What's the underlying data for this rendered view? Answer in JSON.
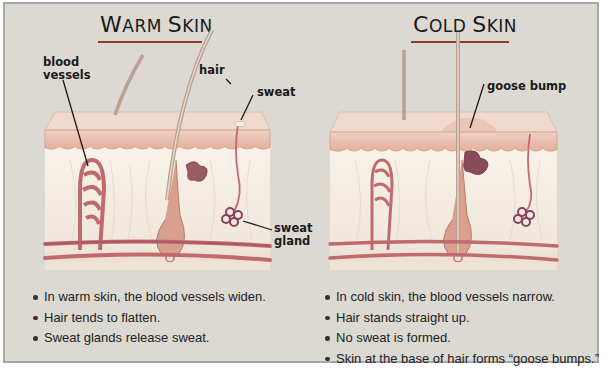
{
  "panels": {
    "warm": {
      "title_first": "W",
      "title_rest": "ARM ",
      "title_first2": "S",
      "title_rest2": "KIN",
      "title_full": "Warm Skin",
      "labels": {
        "blood_vessels_line1": "blood",
        "blood_vessels_line2": "vessels",
        "hair": "hair",
        "sweat": "sweat",
        "sweat_gland_line1": "sweat",
        "sweat_gland_line2": "gland"
      },
      "bullets": [
        "In warm skin, the blood vessels widen.",
        "Hair tends to flatten.",
        "Sweat glands release sweat."
      ]
    },
    "cold": {
      "title_first": "C",
      "title_rest": "OLD ",
      "title_first2": "S",
      "title_rest2": "KIN",
      "title_full": "Cold Skin",
      "labels": {
        "goose_bump": "goose bump"
      },
      "bullets": [
        "In cold skin, the blood vessels narrow.",
        "Hair stands straight up.",
        "No sweat is formed.",
        "Skin at the base of hair forms “goose bumps.”"
      ]
    }
  },
  "colors": {
    "background": "#dcd9d2",
    "border": "#a9a7a2",
    "epidermis": "#e8b9a6",
    "epidermis_top": "#efd2c4",
    "dermis": "#f6efe6",
    "vessel": "#c06a6e",
    "vessel_dark": "#9c4f5c",
    "gland": "#8a4060",
    "title_underline": "#8a3b2a"
  }
}
